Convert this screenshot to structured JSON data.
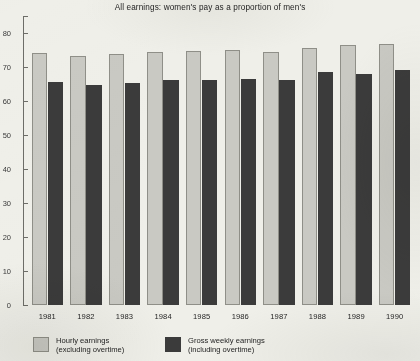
{
  "chart_data": {
    "type": "bar",
    "title": "All earnings: women's pay as a proportion of men's",
    "xlabel": "",
    "ylabel": "",
    "categories": [
      "1981",
      "1982",
      "1983",
      "1984",
      "1985",
      "1986",
      "1987",
      "1988",
      "1989",
      "1990"
    ],
    "series": [
      {
        "name": "Hourly earnings (excluding overtime)",
        "color": "#c9c9c3",
        "values": [
          74.0,
          73.2,
          73.7,
          74.5,
          74.7,
          75.0,
          74.3,
          75.6,
          76.6,
          76.9
        ]
      },
      {
        "name": "Gross weekly earnings (including overtime)",
        "color": "#3b3b3b",
        "values": [
          65.5,
          64.7,
          65.4,
          66.2,
          66.2,
          66.4,
          66.2,
          68.6,
          68.0,
          69.0
        ]
      }
    ],
    "ylim": [
      0,
      85
    ],
    "ytick_values": [
      0,
      10,
      20,
      30,
      40,
      50,
      60,
      70,
      80
    ],
    "ytick_labels": [
      "0",
      "10",
      "20",
      "30",
      "40",
      "50",
      "60",
      "70",
      "80"
    ],
    "ytick_labels_cropped": true,
    "grid": false,
    "legend_position": "bottom-left",
    "legend": [
      {
        "label_line1": "Hourly earnings",
        "label_line2": "(excluding overtime)",
        "swatch": "light"
      },
      {
        "label_line1": "Gross weekly earnings",
        "label_line2": "(including overtime)",
        "swatch": "dark"
      }
    ]
  },
  "colors": {
    "background": "#efefe9",
    "light_bar": "#c9c9c3",
    "light_bar_edge": "#8f8f88",
    "dark_bar": "#3b3b3b",
    "axis": "#6d6d68",
    "text": "#1e1e1e"
  }
}
